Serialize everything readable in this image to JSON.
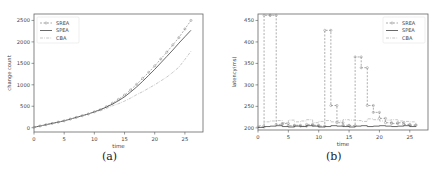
{
  "chart_data": [
    {
      "id": "a",
      "type": "line",
      "caption": "(a)",
      "title": "",
      "xlabel": "time",
      "ylabel": "change count",
      "xlim": [
        0,
        28
      ],
      "ylim": [
        -100,
        2650
      ],
      "xticks": [
        0,
        5,
        10,
        15,
        20,
        25
      ],
      "yticks": [
        0,
        500,
        1000,
        1500,
        2000,
        2500
      ],
      "grid": false,
      "legend_position": "upper left",
      "x": [
        0,
        1,
        2,
        3,
        4,
        5,
        6,
        7,
        8,
        9,
        10,
        11,
        12,
        13,
        14,
        15,
        16,
        17,
        18,
        19,
        20,
        21,
        22,
        23,
        24,
        25,
        26
      ],
      "series": [
        {
          "name": "SREA",
          "style": "dashed-marker",
          "color": "#8a8a8a",
          "values": [
            10,
            40,
            70,
            100,
            130,
            160,
            200,
            240,
            280,
            320,
            370,
            420,
            490,
            570,
            660,
            760,
            880,
            1010,
            1150,
            1290,
            1440,
            1600,
            1760,
            1930,
            2100,
            2300,
            2500
          ]
        },
        {
          "name": "SPEA",
          "style": "solid",
          "color": "#444444",
          "values": [
            10,
            40,
            70,
            100,
            130,
            160,
            200,
            240,
            280,
            320,
            370,
            420,
            480,
            550,
            630,
            720,
            830,
            950,
            1080,
            1220,
            1360,
            1510,
            1660,
            1810,
            1970,
            2120,
            2270
          ]
        },
        {
          "name": "CBA",
          "style": "dashdot-marker",
          "color": "#b0b0b0",
          "values": [
            10,
            40,
            70,
            100,
            130,
            160,
            200,
            240,
            280,
            320,
            360,
            400,
            450,
            510,
            560,
            620,
            690,
            770,
            840,
            920,
            1000,
            1090,
            1180,
            1290,
            1410,
            1590,
            1780
          ]
        }
      ]
    },
    {
      "id": "b",
      "type": "line",
      "caption": "(b)",
      "title": "",
      "xlabel": "time",
      "ylabel": "latency(ms)",
      "xlim": [
        0,
        28
      ],
      "ylim": [
        195,
        465
      ],
      "xticks": [
        0,
        5,
        10,
        15,
        20,
        25
      ],
      "yticks": [
        200,
        250,
        300,
        350,
        400,
        450
      ],
      "grid": false,
      "step": true,
      "legend_position": "upper right",
      "x": [
        0,
        1,
        2,
        3,
        4,
        5,
        6,
        7,
        8,
        9,
        10,
        11,
        12,
        13,
        14,
        15,
        16,
        17,
        18,
        19,
        20,
        21,
        22,
        23,
        24,
        25,
        26
      ],
      "series": [
        {
          "name": "SREA",
          "style": "dashed-marker-step",
          "color": "#8a8a8a",
          "values": [
            202,
            462,
            462,
            208,
            210,
            205,
            206,
            204,
            208,
            206,
            204,
            427,
            252,
            212,
            206,
            205,
            365,
            340,
            252,
            236,
            222,
            212,
            210,
            212,
            208,
            206,
            207
          ]
        },
        {
          "name": "SPEA",
          "style": "solid-step",
          "color": "#444444",
          "values": [
            201,
            203,
            204,
            205,
            203,
            202,
            204,
            203,
            205,
            204,
            202,
            203,
            205,
            204,
            203,
            202,
            204,
            205,
            203,
            204,
            205,
            204,
            203,
            204,
            205,
            203,
            204
          ]
        },
        {
          "name": "CBA",
          "style": "dashdot-step",
          "color": "#b0b0b0",
          "values": [
            205,
            214,
            216,
            217,
            212,
            218,
            214,
            216,
            219,
            212,
            215,
            217,
            214,
            216,
            219,
            218,
            217,
            215,
            221,
            219,
            216,
            218,
            219,
            216,
            215,
            214,
            213
          ]
        }
      ]
    }
  ],
  "legend": {
    "a": [
      "SREA",
      "SPEA",
      "CBA"
    ],
    "b": [
      "SREA",
      "SPEA",
      "CBA"
    ]
  },
  "captions": {
    "a": "(a)",
    "b": "(b)"
  }
}
